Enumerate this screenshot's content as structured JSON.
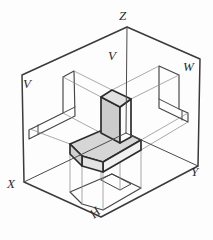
{
  "figure": {
    "width": 213,
    "height": 240,
    "background": "#fdfdfd",
    "labels": [
      {
        "id": "axis-z",
        "text": "Z",
        "x": 119,
        "y": 9,
        "rot": 0
      },
      {
        "id": "plane-v-upper",
        "text": "V",
        "x": 108,
        "y": 49,
        "rot": 0
      },
      {
        "id": "plane-w",
        "text": "W",
        "x": 183,
        "y": 60,
        "rot": 0
      },
      {
        "id": "plane-v-left",
        "text": "V",
        "x": 23,
        "y": 77,
        "rot": 0
      },
      {
        "id": "axis-x",
        "text": "X",
        "x": 7,
        "y": 177,
        "rot": 0
      },
      {
        "id": "axis-y",
        "text": "Y",
        "x": 191,
        "y": 165,
        "rot": 0
      },
      {
        "id": "plane-h",
        "text": "H",
        "x": 90,
        "y": 206,
        "rot": -40
      }
    ],
    "colors": {
      "box_edge": "#3a3a3a",
      "axis_line": "#4a4a4a",
      "view_line": "#454545",
      "ray_line": "#8c8c8c",
      "object_edge": "#2d2d2d",
      "shade_dark": "#cccccc",
      "shade_mid": "#d6d6d6",
      "shade_light": "#e1e1e1",
      "shade_white": "#fbfbfb"
    },
    "primitives": [
      {
        "name": "glass-box-outline",
        "kind": "polygon",
        "points": [
          [
            22,
            75
          ],
          [
            127,
            27
          ],
          [
            200,
            59
          ],
          [
            198,
            166
          ],
          [
            101,
            217
          ],
          [
            24,
            182
          ]
        ],
        "stroke": "#3a3a3a",
        "width": 1.5,
        "fill": "none"
      },
      {
        "name": "front-view-outline",
        "kind": "polygon",
        "points": [
          [
            74,
            71
          ],
          [
            63,
            77
          ],
          [
            63,
            113
          ],
          [
            29,
            130
          ],
          [
            29,
            139
          ],
          [
            75,
            116
          ]
        ],
        "stroke": "#454545",
        "width": 1.15,
        "fill": "none"
      },
      {
        "name": "front-view-slab-base-line",
        "kind": "line",
        "points": [
          [
            75,
            107
          ],
          [
            63,
            113
          ]
        ],
        "stroke": "#454545",
        "width": 1.0,
        "fill": "none"
      },
      {
        "name": "front-view-chamfer-line",
        "kind": "line",
        "points": [
          [
            38,
            125
          ],
          [
            38,
            134
          ]
        ],
        "stroke": "#454545",
        "width": 1.0,
        "fill": "none"
      },
      {
        "name": "side-view-outline",
        "kind": "polygon",
        "points": [
          [
            159,
            66
          ],
          [
            179,
            75
          ],
          [
            179,
            109
          ],
          [
            188,
            113
          ],
          [
            188,
            122
          ],
          [
            159,
            108
          ]
        ],
        "stroke": "#454545",
        "width": 1.15,
        "fill": "none"
      },
      {
        "name": "side-view-slab-base-line",
        "kind": "line",
        "points": [
          [
            159,
            99
          ],
          [
            179,
            109
          ]
        ],
        "stroke": "#454545",
        "width": 1.0,
        "fill": "none"
      },
      {
        "name": "side-view-chamfer-line",
        "kind": "line",
        "points": [
          [
            182,
            111
          ],
          [
            182,
            120
          ]
        ],
        "stroke": "#454545",
        "width": 1.0,
        "fill": "none"
      },
      {
        "name": "top-view-outline",
        "kind": "polygon",
        "points": [
          [
            112,
            174
          ],
          [
            141,
            188
          ],
          [
            103,
            210
          ],
          [
            82,
            204
          ],
          [
            70,
            192
          ]
        ],
        "stroke": "#454545",
        "width": 1.15,
        "fill": "none"
      },
      {
        "name": "top-view-slab-outline",
        "kind": "polygon",
        "points": [
          [
            112,
            174
          ],
          [
            131,
            184
          ],
          [
            120,
            190
          ],
          [
            101,
            180
          ]
        ],
        "stroke": "#454545",
        "width": 1.0,
        "fill": "none"
      },
      {
        "name": "projection-ray-v-1",
        "kind": "line",
        "points": [
          [
            112,
            90
          ],
          [
            74,
            71
          ]
        ],
        "stroke": "#8c8c8c",
        "width": 0.75,
        "fill": "none"
      },
      {
        "name": "projection-ray-v-2",
        "kind": "line",
        "points": [
          [
            101,
            97
          ],
          [
            63,
            77
          ]
        ],
        "stroke": "#8c8c8c",
        "width": 0.75,
        "fill": "none"
      },
      {
        "name": "projection-ray-v-3",
        "kind": "line",
        "points": [
          [
            101,
            133
          ],
          [
            63,
            113
          ]
        ],
        "stroke": "#8c8c8c",
        "width": 0.75,
        "fill": "none"
      },
      {
        "name": "projection-ray-v-4",
        "kind": "line",
        "points": [
          [
            70,
            144
          ],
          [
            30,
            129
          ]
        ],
        "stroke": "#8c8c8c",
        "width": 0.75,
        "fill": "none"
      },
      {
        "name": "projection-ray-w-1",
        "kind": "line",
        "points": [
          [
            112,
            90
          ],
          [
            159,
            66
          ]
        ],
        "stroke": "#8c8c8c",
        "width": 0.75,
        "fill": "none"
      },
      {
        "name": "projection-ray-w-2",
        "kind": "line",
        "points": [
          [
            131,
            99
          ],
          [
            179,
            75
          ]
        ],
        "stroke": "#8c8c8c",
        "width": 0.75,
        "fill": "none"
      },
      {
        "name": "projection-ray-w-3",
        "kind": "line",
        "points": [
          [
            141,
            140
          ],
          [
            188,
            113
          ]
        ],
        "stroke": "#8c8c8c",
        "width": 0.75,
        "fill": "none"
      },
      {
        "name": "projection-ray-w-4",
        "kind": "line",
        "points": [
          [
            141,
            150
          ],
          [
            188,
            122
          ]
        ],
        "stroke": "#8c8c8c",
        "width": 0.75,
        "fill": "none"
      },
      {
        "name": "projection-ray-h-1",
        "kind": "line",
        "points": [
          [
            70,
            154
          ],
          [
            70,
            192
          ]
        ],
        "stroke": "#8c8c8c",
        "width": 0.75,
        "fill": "none"
      },
      {
        "name": "projection-ray-h-2",
        "kind": "line",
        "points": [
          [
            82,
            166
          ],
          [
            82,
            204
          ]
        ],
        "stroke": "#8c8c8c",
        "width": 0.75,
        "fill": "none"
      },
      {
        "name": "projection-ray-h-3",
        "kind": "line",
        "points": [
          [
            103,
            172
          ],
          [
            103,
            210
          ]
        ],
        "stroke": "#8c8c8c",
        "width": 0.75,
        "fill": "none"
      },
      {
        "name": "projection-ray-h-4",
        "kind": "line",
        "points": [
          [
            141,
            150
          ],
          [
            141,
            188
          ]
        ],
        "stroke": "#8c8c8c",
        "width": 0.75,
        "fill": "none"
      },
      {
        "name": "projection-ray-h-5",
        "kind": "line",
        "points": [
          [
            101,
            133
          ],
          [
            101,
            180
          ]
        ],
        "stroke": "#8c8c8c",
        "width": 0.75,
        "fill": "none"
      },
      {
        "name": "projection-ray-h-6",
        "kind": "line",
        "points": [
          [
            120,
            143
          ],
          [
            120,
            190
          ]
        ],
        "stroke": "#8c8c8c",
        "width": 0.75,
        "fill": "none"
      },
      {
        "name": "object-seat-top-face",
        "kind": "polygon",
        "points": [
          [
            112,
            126
          ],
          [
            141,
            140
          ],
          [
            103,
            162
          ],
          [
            82,
            156
          ],
          [
            70,
            144
          ]
        ],
        "stroke": "#2d2d2d",
        "width": 1.7,
        "fill": "#d6d6d6"
      },
      {
        "name": "object-seat-front-right-face",
        "kind": "polygon",
        "points": [
          [
            141,
            140
          ],
          [
            103,
            162
          ],
          [
            103,
            172
          ],
          [
            141,
            150
          ]
        ],
        "stroke": "#2d2d2d",
        "width": 1.7,
        "fill": "#f1f1f1"
      },
      {
        "name": "object-seat-front-left-face",
        "kind": "polygon",
        "points": [
          [
            103,
            162
          ],
          [
            82,
            156
          ],
          [
            82,
            166
          ],
          [
            103,
            172
          ]
        ],
        "stroke": "#2d2d2d",
        "width": 1.7,
        "fill": "#e3e3e3"
      },
      {
        "name": "object-seat-chamfer-face",
        "kind": "polygon",
        "points": [
          [
            82,
            156
          ],
          [
            70,
            144
          ],
          [
            70,
            154
          ],
          [
            82,
            166
          ]
        ],
        "stroke": "#2d2d2d",
        "width": 1.7,
        "fill": "#cfcfcf"
      },
      {
        "name": "object-slab-left-face",
        "kind": "polygon",
        "points": [
          [
            101,
            97
          ],
          [
            120,
            107
          ],
          [
            120,
            143
          ],
          [
            101,
            133
          ]
        ],
        "stroke": "#2d2d2d",
        "width": 1.7,
        "fill": "#cccccc"
      },
      {
        "name": "object-slab-right-face",
        "kind": "polygon",
        "points": [
          [
            120,
            107
          ],
          [
            131,
            99
          ],
          [
            131,
            137
          ],
          [
            120,
            143
          ]
        ],
        "stroke": "#2d2d2d",
        "width": 1.7,
        "fill": "#fbfbfb"
      },
      {
        "name": "object-slab-top-face",
        "kind": "polygon",
        "points": [
          [
            112,
            90
          ],
          [
            131,
            99
          ],
          [
            120,
            107
          ],
          [
            101,
            97
          ]
        ],
        "stroke": "#2d2d2d",
        "width": 1.7,
        "fill": "#e1e1e1"
      },
      {
        "name": "z-axis-line",
        "kind": "line",
        "points": [
          [
            126,
            133
          ],
          [
            127,
            27
          ]
        ],
        "stroke": "#4a4a4a",
        "width": 1.0,
        "fill": "none"
      },
      {
        "name": "x-axis-line",
        "kind": "line",
        "points": [
          [
            126,
            133
          ],
          [
            24,
            182
          ]
        ],
        "stroke": "#4a4a4a",
        "width": 1.0,
        "fill": "none"
      },
      {
        "name": "y-axis-line",
        "kind": "line",
        "points": [
          [
            126,
            133
          ],
          [
            198,
            166
          ]
        ],
        "stroke": "#4a4a4a",
        "width": 1.0,
        "fill": "none"
      }
    ]
  }
}
